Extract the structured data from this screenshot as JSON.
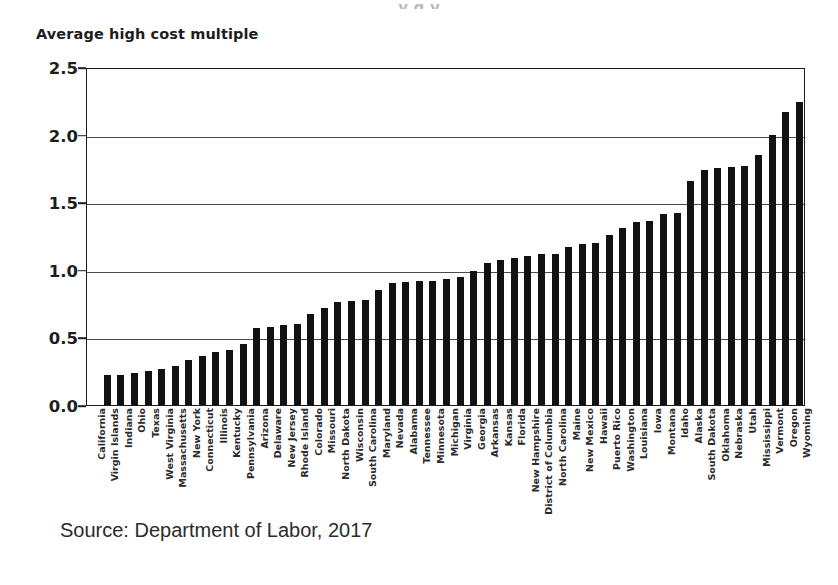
{
  "cut_title_fragment": "y  g                                        y",
  "axis_title": "Average high cost multiple",
  "source_note": "Source:  Department of Labor, 2017",
  "colors": {
    "bar": "#121212",
    "axis": "#1d1d1b",
    "grid": "#4a4a4a",
    "background": "#ffffff"
  },
  "chart_data": {
    "type": "bar",
    "title": "",
    "xlabel": "",
    "ylabel": "Average high cost multiple",
    "ylim": [
      0.0,
      2.5
    ],
    "yticks": [
      0.0,
      0.5,
      1.0,
      1.5,
      2.0,
      2.5
    ],
    "ytick_labels": [
      "0.0",
      "0.5",
      "1.0",
      "1.5",
      "2.0",
      "2.5"
    ],
    "grid": true,
    "legend": "none",
    "orientation": "vertical",
    "sorted": "ascending",
    "categories": [
      "California",
      "Virgin Islands",
      "Indiana",
      "Ohio",
      "Texas",
      "West Virginia",
      "Massachusetts",
      "New York",
      "Connecticut",
      "Illinois",
      "Kentucky",
      "Pennsylvania",
      "Arizona",
      "Delaware",
      "New Jersey",
      "Rhode Island",
      "Colorado",
      "Missouri",
      "North Dakota",
      "Wisconsin",
      "South Carolina",
      "Maryland",
      "Nevada",
      "Alabama",
      "Tennessee",
      "Minnesota",
      "Michigan",
      "Virginia",
      "Georgia",
      "Arkansas",
      "Kansas",
      "Florida",
      "New Hampshire",
      "District of Columbia",
      "North Carolina",
      "Maine",
      "New Mexico",
      "Hawaii",
      "Puerto Rico",
      "Washington",
      "Louisiana",
      "Iowa",
      "Montana",
      "Idaho",
      "Alaska",
      "South Dakota",
      "Oklahoma",
      "Nebraska",
      "Utah",
      "Mississippi",
      "Vermont",
      "Oregon",
      "Wyoming"
    ],
    "values": [
      0.0,
      0.22,
      0.22,
      0.24,
      0.25,
      0.27,
      0.29,
      0.33,
      0.36,
      0.39,
      0.41,
      0.45,
      0.57,
      0.58,
      0.59,
      0.6,
      0.67,
      0.72,
      0.76,
      0.77,
      0.78,
      0.85,
      0.9,
      0.91,
      0.92,
      0.92,
      0.93,
      0.95,
      0.99,
      1.05,
      1.07,
      1.09,
      1.1,
      1.12,
      1.12,
      1.17,
      1.19,
      1.2,
      1.26,
      1.31,
      1.35,
      1.36,
      1.41,
      1.42,
      1.66,
      1.74,
      1.75,
      1.76,
      1.77,
      1.85,
      2.0,
      2.17,
      2.24
    ]
  }
}
